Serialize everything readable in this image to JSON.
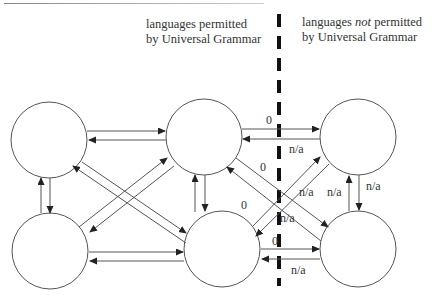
{
  "labels": {
    "left_region_line1": "languages permitted",
    "left_region_line2": "by Universal Grammar",
    "right_region_line1_pre": "languages ",
    "right_region_line1_em": "not",
    "right_region_line1_post": " permitted",
    "right_region_line2": "by Universal Grammar"
  },
  "nodes": [
    {
      "id": "TL",
      "cx": 49,
      "cy": 140,
      "r": 38
    },
    {
      "id": "TM",
      "cx": 204,
      "cy": 137,
      "r": 38
    },
    {
      "id": "TR",
      "cx": 358,
      "cy": 137,
      "r": 38
    },
    {
      "id": "BL",
      "cx": 50,
      "cy": 251,
      "r": 38
    },
    {
      "id": "BM",
      "cx": 222,
      "cy": 249,
      "r": 38
    },
    {
      "id": "BR",
      "cx": 358,
      "cy": 249,
      "r": 38
    }
  ],
  "edge_labels": {
    "tm_to_tr": "0",
    "tr_to_tm": "n/a",
    "bm_to_tr": "0",
    "tm_to_br": "n/a",
    "tr_to_bm": "n/a",
    "br_to_tr": "n/a",
    "tr_to_br": "n/a",
    "bm_to_br": "0",
    "br_to_bm": "n/a",
    "cross_zero": "0"
  },
  "divider": {
    "x": 279,
    "style": "thick-dashed",
    "color": "#111111"
  },
  "colors": {
    "stroke": "#555555",
    "text": "#333333",
    "divider": "#111111"
  }
}
